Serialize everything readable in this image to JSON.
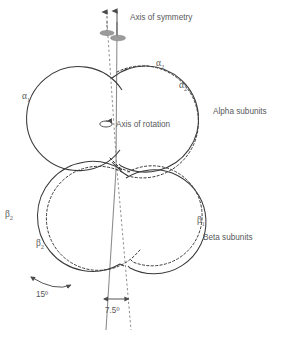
{
  "figure": {
    "background_color": "#ffffff",
    "line_color": "#3a3a3a",
    "axis_color": "#8e8e8e",
    "text_color": "#58585a"
  },
  "annotations": {
    "axis_of_symmetry": "Axis of symmetry",
    "axis_of_rotation": "Axis of rotation",
    "alpha_subunits": "Alpha subunits",
    "beta_subunits": "Beta subunits",
    "angle_large": "15º",
    "angle_small": "7.5º"
  },
  "subunits": [
    {
      "id": "alpha1",
      "symbol": "α",
      "subscript": "1",
      "style": "solid",
      "group": "alpha",
      "cx": 72,
      "cy": 123,
      "r": 52
    },
    {
      "id": "alpha2-solid",
      "symbol": "α",
      "subscript": "2",
      "style": "solid",
      "group": "alpha",
      "cx": 163,
      "cy": 119,
      "r": 53
    },
    {
      "id": "alpha2-dashed",
      "symbol": "α",
      "subscript": "2",
      "style": "dashed",
      "group": "alpha",
      "cx": 167,
      "cy": 115,
      "r": 56
    },
    {
      "id": "beta2-solid",
      "symbol": "β",
      "subscript": "2",
      "style": "solid",
      "group": "beta",
      "cx": 78,
      "cy": 218,
      "r": 55
    },
    {
      "id": "beta2-dashed",
      "symbol": "β",
      "subscript": "2",
      "style": "dashed",
      "group": "beta",
      "cx": 96,
      "cy": 222,
      "r": 52
    },
    {
      "id": "beta1-solid",
      "symbol": "β",
      "subscript": "1",
      "style": "solid",
      "group": "beta",
      "cx": 168,
      "cy": 216,
      "r": 52
    },
    {
      "id": "beta1-dashed",
      "symbol": "β",
      "subscript": "1",
      "style": "dashed",
      "group": "beta",
      "cx": 155,
      "cy": 215,
      "r": 50
    }
  ],
  "axes": [
    {
      "id": "symmetry-solid",
      "style": "solid",
      "label": "Axis of symmetry"
    },
    {
      "id": "symmetry-dashed",
      "style": "dashed",
      "label": "Axis of symmetry"
    }
  ],
  "greek_labels": [
    {
      "id": "alpha1-label",
      "symbol": "α",
      "subscript": "1",
      "x": 22,
      "y": 99
    },
    {
      "id": "alpha2-dashed-label",
      "symbol": "α",
      "subscript": "2",
      "x": 156,
      "y": 66
    },
    {
      "id": "alpha2-solid-label",
      "symbol": "α",
      "subscript": "2",
      "x": 179,
      "y": 88
    },
    {
      "id": "beta2-solid-label",
      "symbol": "β",
      "subscript": "2",
      "x": 5,
      "y": 217
    },
    {
      "id": "beta2-dashed-label",
      "symbol": "β",
      "subscript": "2",
      "x": 36,
      "y": 246
    },
    {
      "id": "beta1-label",
      "symbol": "β",
      "subscript": "1",
      "x": 197,
      "y": 223
    }
  ]
}
